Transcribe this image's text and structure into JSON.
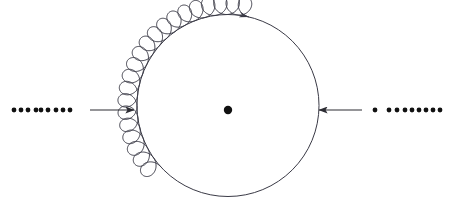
{
  "figure": {
    "background_color": "#ffffff",
    "stroke_color": "#3a3a46",
    "dot_color": "#111111",
    "arrow_color": "#2c2c33",
    "width": 453,
    "height": 207
  },
  "main_circle": {
    "name": "orbit-circle",
    "center_x": 228,
    "center_y": 105.5,
    "radius": 91,
    "stroke_width": 1.0,
    "fill": "none"
  },
  "center_point": {
    "name": "center-dot",
    "x": 228,
    "y": 110,
    "radius": 4.2,
    "color": "#111111"
  },
  "cycloid": {
    "name": "cycloid-loop-path",
    "description": "small looping curl path riding the left arc of the orbit circle",
    "loop_count": 21,
    "loop_radius": 9.6,
    "base_radius": 91,
    "start_angle_deg": 138,
    "end_angle_deg": 283,
    "stroke_width": 1.0,
    "has_arrowhead": true,
    "arrowhead_x": 233,
    "arrowhead_y": 13
  },
  "left_arrow": {
    "name": "left-incoming-arrow",
    "x1": 90,
    "y1": 110,
    "x2": 134,
    "y2": 110,
    "direction": "right",
    "stroke_width": 1.1
  },
  "right_arrow": {
    "name": "right-incoming-arrow",
    "x1": 362,
    "y1": 110,
    "x2": 319,
    "y2": 110,
    "direction": "left",
    "stroke_width": 1.1
  },
  "left_dots": {
    "name": "left-dot-series",
    "y": 110,
    "radius": 2.4,
    "x_positions": [
      14,
      21,
      28,
      36,
      41,
      48,
      56,
      63,
      70
    ]
  },
  "right_dots": {
    "name": "right-dot-series",
    "y": 110,
    "radius": 2.4,
    "x_positions": [
      375,
      389,
      397,
      405,
      412,
      419,
      426,
      433,
      440
    ]
  }
}
